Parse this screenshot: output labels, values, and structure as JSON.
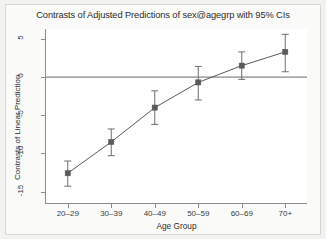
{
  "chart_data": {
    "type": "line",
    "title": "Contrasts of Adjusted Predictions of sex@agegrp with 95% CIs",
    "xlabel": "Age Group",
    "ylabel": "Contrasts of Linear Prediction",
    "categories": [
      "20–29",
      "30–39",
      "40–49",
      "50–59",
      "60–69",
      "70+"
    ],
    "values": [
      -12.6,
      -8.5,
      -4.0,
      -0.7,
      1.5,
      3.3
    ],
    "ci_lower": [
      -14.3,
      -10.3,
      -6.2,
      -3.0,
      -0.3,
      0.7
    ],
    "ci_upper": [
      -11.0,
      -6.8,
      -1.8,
      1.4,
      3.3,
      5.6
    ],
    "yticks": [
      5,
      0,
      -5,
      -10,
      -15
    ],
    "ytick_labels": [
      "5",
      "0",
      "-5",
      "-10",
      "-15"
    ],
    "ylim": [
      -16.5,
      6.3
    ],
    "grid": false,
    "reference_line_y": 0,
    "legend": null,
    "marker": "square",
    "series_color": "#5a5a5a",
    "ci_color": "#6e6e6e",
    "background_color": "#ffffff",
    "frame_color": "#d8d8d6"
  }
}
